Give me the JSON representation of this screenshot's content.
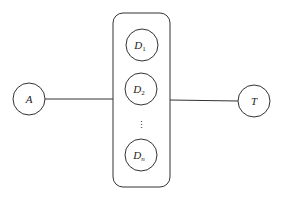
{
  "diagram": {
    "type": "star-through-group",
    "nodes": {
      "source": {
        "label": "A"
      },
      "target": {
        "label": "T"
      },
      "group": {
        "members": [
          {
            "base": "D",
            "sub": "1"
          },
          {
            "base": "D",
            "sub": "2"
          },
          {
            "ellipsis": "⋮"
          },
          {
            "base": "D",
            "sub": "n"
          }
        ]
      }
    },
    "edges": [
      {
        "from": "A",
        "to": "group"
      },
      {
        "from": "group",
        "to": "T"
      }
    ],
    "colors": {
      "stroke": "#333333",
      "background": "#ffffff"
    }
  }
}
